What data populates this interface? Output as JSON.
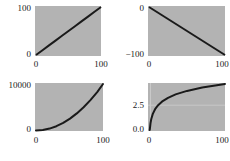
{
  "figure": {
    "panel_background": "#b3b3b3",
    "figure_background": "#ffffff",
    "line_color": "#1a1a1a",
    "grid_color": "#c9c9c9",
    "layout": "2x2 grid of line plots"
  },
  "chart_data": [
    {
      "type": "line",
      "name": "linear",
      "position": "top-left",
      "title": "",
      "xlabel": "",
      "ylabel": "",
      "xlim": [
        0,
        100
      ],
      "ylim": [
        0,
        100
      ],
      "xticks": [
        "0",
        "100"
      ],
      "yticks": [
        "0",
        "100"
      ],
      "xtick_values": [
        0,
        100
      ],
      "ytick_values": [
        0,
        100
      ],
      "grid": false,
      "series": [
        {
          "name": "y = x",
          "x": [
            0,
            10,
            20,
            30,
            40,
            50,
            60,
            70,
            80,
            90,
            100
          ],
          "values": [
            0,
            10,
            20,
            30,
            40,
            50,
            60,
            70,
            80,
            90,
            100
          ]
        }
      ]
    },
    {
      "type": "line",
      "name": "negative-linear",
      "position": "top-right",
      "title": "",
      "xlabel": "",
      "ylabel": "",
      "xlim": [
        0,
        100
      ],
      "ylim": [
        -100,
        0
      ],
      "xticks": [
        "0",
        "100"
      ],
      "yticks": [
        "−100",
        "0"
      ],
      "xtick_values": [
        0,
        100
      ],
      "ytick_values": [
        -100,
        0
      ],
      "grid": false,
      "series": [
        {
          "name": "y = -x",
          "x": [
            0,
            10,
            20,
            30,
            40,
            50,
            60,
            70,
            80,
            90,
            100
          ],
          "values": [
            0,
            -10,
            -20,
            -30,
            -40,
            -50,
            -60,
            -70,
            -80,
            -90,
            -100
          ]
        }
      ]
    },
    {
      "type": "line",
      "name": "quadratic",
      "position": "bottom-left",
      "title": "",
      "xlabel": "",
      "ylabel": "",
      "xlim": [
        0,
        100
      ],
      "ylim": [
        0,
        10000
      ],
      "xticks": [
        "0",
        "100"
      ],
      "yticks": [
        "0",
        "10000"
      ],
      "xtick_values": [
        0,
        100
      ],
      "ytick_values": [
        0,
        10000
      ],
      "grid": false,
      "series": [
        {
          "name": "y = x^2",
          "x": [
            0,
            10,
            20,
            30,
            40,
            50,
            60,
            70,
            80,
            90,
            100
          ],
          "values": [
            0,
            100,
            400,
            900,
            1600,
            2500,
            3600,
            4900,
            6400,
            8100,
            10000
          ]
        }
      ]
    },
    {
      "type": "line",
      "name": "logarithmic",
      "position": "bottom-right",
      "title": "",
      "xlabel": "",
      "ylabel": "",
      "xlim": [
        0,
        100
      ],
      "ylim": [
        0.0,
        4.6
      ],
      "xticks": [
        "0",
        "100"
      ],
      "yticks": [
        "0.0",
        "2.5"
      ],
      "xtick_values": [
        0,
        100
      ],
      "ytick_values": [
        0.0,
        2.5
      ],
      "grid": true,
      "series": [
        {
          "name": "y = log(x)",
          "x": [
            1,
            2,
            3,
            5,
            8,
            12,
            18,
            25,
            35,
            50,
            70,
            100
          ],
          "values": [
            0.0,
            0.69,
            1.1,
            1.61,
            2.08,
            2.48,
            2.89,
            3.22,
            3.56,
            3.91,
            4.25,
            4.61
          ]
        }
      ]
    }
  ],
  "panels": {
    "linear": {
      "ytick_top": "100",
      "ytick_bottom": "0",
      "xtick_left": "0",
      "xtick_right": "100"
    },
    "negative": {
      "ytick_top": "0",
      "ytick_bottom": "−100",
      "xtick_left": "0",
      "xtick_right": "100"
    },
    "quadratic": {
      "ytick_top": "10000",
      "ytick_bottom": "0",
      "xtick_left": "0",
      "xtick_right": "100"
    },
    "logarithmic": {
      "ytick_mid": "2.5",
      "ytick_bottom": "0.0",
      "xtick_left": "0",
      "xtick_right": "100"
    }
  }
}
